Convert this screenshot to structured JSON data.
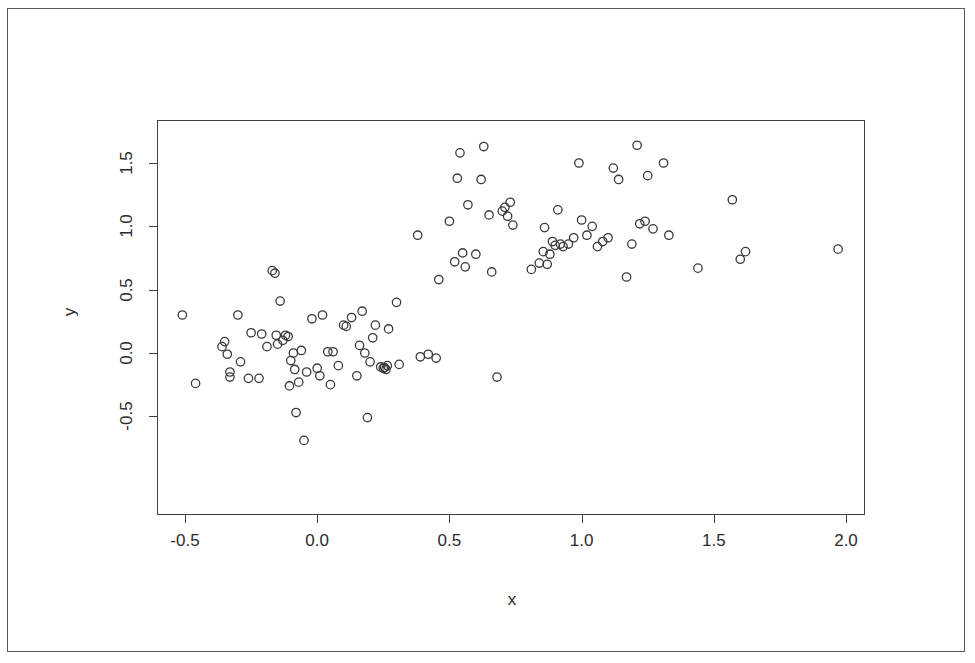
{
  "figure": {
    "background_color": "#ffffff",
    "frame_color": "#5a5a5a",
    "axis_color": "#404040",
    "point_color": "#3a3a3a"
  },
  "chart_data": {
    "type": "scatter",
    "title": "",
    "xlabel": "x",
    "ylabel": "y",
    "xlim": [
      -0.58,
      2.08
    ],
    "ylim": [
      -0.78,
      1.74
    ],
    "grid": false,
    "legend": null,
    "marker": "open-circle",
    "xticks": [
      -0.5,
      0.0,
      0.5,
      1.0,
      1.5,
      2.0
    ],
    "xticklabels": [
      "-0.5",
      "0.0",
      "0.5",
      "1.0",
      "1.5",
      "2.0"
    ],
    "yticks": [
      -0.5,
      0.0,
      0.5,
      1.0,
      1.5
    ],
    "yticklabels": [
      "-0.5",
      "0.0",
      "0.5",
      "1.0",
      "1.5"
    ],
    "n_points": 103,
    "x": [
      -0.51,
      -0.46,
      -0.36,
      -0.35,
      -0.34,
      -0.33,
      -0.33,
      -0.3,
      -0.29,
      -0.26,
      -0.25,
      -0.22,
      -0.21,
      -0.19,
      -0.17,
      -0.16,
      -0.155,
      -0.15,
      -0.14,
      -0.13,
      -0.12,
      -0.11,
      -0.105,
      -0.1,
      -0.09,
      -0.085,
      -0.08,
      -0.07,
      -0.06,
      -0.05,
      -0.04,
      -0.02,
      0.0,
      0.01,
      0.02,
      0.04,
      0.05,
      0.06,
      0.08,
      0.1,
      0.11,
      0.13,
      0.15,
      0.16,
      0.17,
      0.18,
      0.19,
      0.2,
      0.21,
      0.22,
      0.24,
      0.25,
      0.255,
      0.26,
      0.265,
      0.27,
      0.3,
      0.31,
      0.38,
      0.39,
      0.42,
      0.45,
      0.46,
      0.5,
      0.52,
      0.53,
      0.54,
      0.55,
      0.56,
      0.57,
      0.6,
      0.62,
      0.63,
      0.65,
      0.66,
      0.68,
      0.7,
      0.71,
      0.72,
      0.73,
      0.74,
      0.81,
      0.84,
      0.855,
      0.86,
      0.87,
      0.88,
      0.89,
      0.9,
      0.91,
      0.92,
      0.93,
      0.95,
      0.97,
      0.99,
      1.0,
      1.02,
      1.04,
      1.06,
      1.08,
      1.1,
      1.12,
      1.14,
      1.17,
      1.19,
      1.21,
      1.22,
      1.24,
      1.25,
      1.27,
      1.31,
      1.33,
      1.44,
      1.57,
      1.6,
      1.62,
      1.97
    ],
    "y": [
      0.3,
      -0.24,
      0.05,
      0.09,
      -0.01,
      -0.15,
      -0.19,
      0.3,
      -0.07,
      -0.2,
      0.16,
      -0.2,
      0.15,
      0.05,
      0.65,
      0.63,
      0.14,
      0.07,
      0.41,
      0.1,
      0.14,
      0.13,
      -0.26,
      -0.06,
      0.0,
      -0.13,
      -0.47,
      -0.23,
      0.02,
      -0.69,
      -0.15,
      0.27,
      -0.12,
      -0.18,
      0.3,
      0.01,
      -0.25,
      0.01,
      -0.1,
      0.22,
      0.21,
      0.28,
      -0.18,
      0.06,
      0.33,
      0.0,
      -0.51,
      -0.07,
      0.12,
      0.22,
      -0.11,
      -0.12,
      -0.115,
      -0.13,
      -0.1,
      0.19,
      0.4,
      -0.09,
      0.93,
      -0.03,
      -0.01,
      -0.04,
      0.58,
      1.04,
      0.72,
      1.38,
      1.58,
      0.79,
      0.68,
      1.17,
      0.78,
      1.37,
      1.63,
      1.09,
      0.64,
      -0.19,
      1.12,
      1.15,
      1.08,
      1.19,
      1.01,
      0.66,
      0.71,
      0.8,
      0.99,
      0.7,
      0.78,
      0.88,
      0.85,
      1.13,
      0.86,
      0.84,
      0.86,
      0.91,
      1.5,
      1.05,
      0.93,
      1.0,
      0.84,
      0.88,
      0.91,
      1.46,
      1.37,
      0.6,
      0.86,
      1.64,
      1.02,
      1.04,
      1.4,
      0.98,
      1.5,
      0.93,
      0.67,
      1.21,
      0.74,
      0.8,
      0.82
    ]
  },
  "labels": {
    "x_axis_title": "x",
    "y_axis_title": "y"
  }
}
